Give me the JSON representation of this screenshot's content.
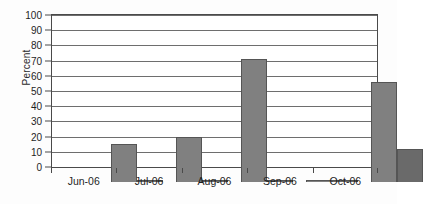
{
  "chart_data": {
    "type": "bar",
    "title": "",
    "subtitle": "",
    "xlabel": "",
    "ylabel": "Percent",
    "categories": [
      "Jun-06",
      "Jul-06",
      "Aug-06",
      "Sep-06",
      "Oct-06"
    ],
    "series": [
      {
        "name": "Series 1",
        "color": "#808080",
        "values": [
          25,
          29.5,
          81,
          1,
          66
        ]
      },
      {
        "name": "Series 2",
        "color": "#6a6a6a",
        "values": [
          1,
          1,
          1,
          1,
          21.5
        ]
      }
    ],
    "ylim": [
      0,
      100
    ],
    "ytick_step": 10,
    "ytick_labels": [
      "0",
      "10",
      "20",
      "30",
      "40",
      "50",
      "60",
      "70",
      "80",
      "90",
      "100"
    ],
    "grid": true,
    "grid_axis": "y",
    "legend": false,
    "legend_position": "none",
    "annotations": [],
    "plot_border": true,
    "bar_orientation": "vertical",
    "grouping": "clustered"
  }
}
